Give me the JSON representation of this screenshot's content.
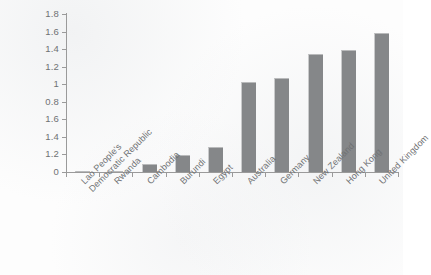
{
  "chart_data": {
    "type": "bar",
    "title": "",
    "xlabel": "",
    "ylabel": "",
    "ylim": [
      0,
      1.8
    ],
    "grid": false,
    "legend": null,
    "orientation": "vertical",
    "bar_color": "#858789",
    "axis_color": "#9a9a9a",
    "categories": [
      "Lao People's Democratic Republic",
      "Rwanda",
      "Cambodia",
      "Burundi",
      "Egypt",
      "Australia",
      "Germany",
      "New Zealand",
      "Hong Kong",
      "United Kingdom"
    ],
    "category_lines": [
      [
        "Lao People's",
        "Democratic Republic"
      ],
      [
        "Rwanda"
      ],
      [
        "Cambodia"
      ],
      [
        "Burundi"
      ],
      [
        "Egypt"
      ],
      [
        "Australia"
      ],
      [
        "Germany"
      ],
      [
        "New Zealand"
      ],
      [
        "Hong Kong"
      ],
      [
        "United Kingdom"
      ]
    ],
    "values": [
      0.01,
      0.01,
      0.09,
      0.19,
      0.29,
      1.03,
      1.07,
      1.35,
      1.39,
      1.58
    ],
    "ytick_values": [
      1.8,
      1.6,
      1.4,
      1.2,
      1.0,
      0.8,
      0.6,
      0.4,
      0.2,
      0
    ],
    "ytick_labels": [
      "1.8",
      "1.6",
      "1.4",
      "1.2",
      "1",
      "0.8",
      "1.6",
      "1.4",
      "1.2",
      "0"
    ]
  },
  "source_note": ""
}
